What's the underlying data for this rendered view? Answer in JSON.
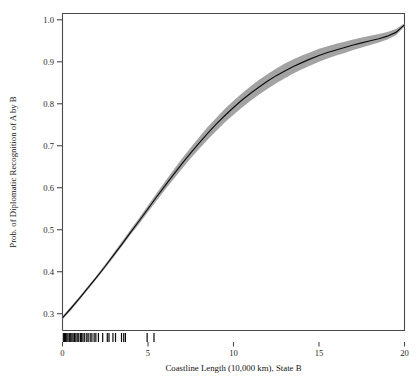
{
  "figure": {
    "width": 419,
    "height": 377,
    "background": "#ffffff"
  },
  "chart_data": {
    "type": "line",
    "title": "",
    "subtitle": "",
    "xlabel": "Coastline Length (10,000 km), State B",
    "ylabel": "Prob. of Diplomatic Recognition of A by B",
    "xlim": [
      0,
      20
    ],
    "ylim": [
      0.26,
      1.015
    ],
    "grid": false,
    "legend": null,
    "xticks": [
      0,
      5,
      10,
      15,
      20
    ],
    "xticklabels": [
      "0",
      "5",
      "10",
      "15",
      "20"
    ],
    "yticks": [
      0.3,
      0.4,
      0.5,
      0.6,
      0.7,
      0.8,
      0.9,
      1.0
    ],
    "yticklabels": [
      "0.3",
      "0.4",
      "0.5",
      "0.6",
      "0.7",
      "0.8",
      "0.9",
      "1.0"
    ],
    "colors": {
      "line": "#0d0d0d",
      "confidence_band": "#a3a3a3",
      "axis": "#4a4a4a",
      "rug": "#0a0a0a"
    },
    "series": [
      {
        "name": "Predicted probability",
        "style": "solid-line",
        "x": [
          0,
          0.5,
          1,
          1.5,
          2,
          2.5,
          3,
          3.5,
          4,
          4.5,
          5,
          5.5,
          6,
          6.5,
          7,
          7.5,
          8,
          8.5,
          9,
          9.5,
          10,
          10.5,
          11,
          11.5,
          12,
          12.5,
          13,
          13.5,
          14,
          14.5,
          15,
          15.5,
          16,
          16.5,
          17,
          17.5,
          18,
          18.5,
          19,
          19.5,
          20
        ],
        "values": [
          0.29,
          0.313,
          0.337,
          0.362,
          0.387,
          0.413,
          0.44,
          0.467,
          0.495,
          0.522,
          0.55,
          0.578,
          0.605,
          0.632,
          0.658,
          0.683,
          0.707,
          0.73,
          0.752,
          0.772,
          0.791,
          0.809,
          0.825,
          0.84,
          0.854,
          0.867,
          0.878,
          0.889,
          0.898,
          0.907,
          0.915,
          0.922,
          0.928,
          0.934,
          0.94,
          0.945,
          0.95,
          0.955,
          0.961,
          0.97,
          0.988
        ]
      },
      {
        "name": "95% confidence band — lower",
        "style": "band-lower",
        "x": [
          0,
          0.5,
          1,
          1.5,
          2,
          2.5,
          3,
          3.5,
          4,
          4.5,
          5,
          5.5,
          6,
          6.5,
          7,
          7.5,
          8,
          8.5,
          9,
          9.5,
          10,
          10.5,
          11,
          11.5,
          12,
          12.5,
          13,
          13.5,
          14,
          14.5,
          15,
          15.5,
          16,
          16.5,
          17,
          17.5,
          18,
          18.5,
          19,
          19.5,
          20
        ],
        "values": [
          0.286,
          0.309,
          0.333,
          0.358,
          0.383,
          0.409,
          0.435,
          0.462,
          0.489,
          0.515,
          0.542,
          0.569,
          0.595,
          0.621,
          0.646,
          0.67,
          0.693,
          0.715,
          0.736,
          0.756,
          0.774,
          0.791,
          0.807,
          0.822,
          0.836,
          0.849,
          0.861,
          0.872,
          0.882,
          0.891,
          0.9,
          0.908,
          0.915,
          0.921,
          0.928,
          0.934,
          0.94,
          0.946,
          0.953,
          0.963,
          0.984
        ]
      },
      {
        "name": "95% confidence band — upper",
        "style": "band-upper",
        "x": [
          0,
          0.5,
          1,
          1.5,
          2,
          2.5,
          3,
          3.5,
          4,
          4.5,
          5,
          5.5,
          6,
          6.5,
          7,
          7.5,
          8,
          8.5,
          9,
          9.5,
          10,
          10.5,
          11,
          11.5,
          12,
          12.5,
          13,
          13.5,
          14,
          14.5,
          15,
          15.5,
          16,
          16.5,
          17,
          17.5,
          18,
          18.5,
          19,
          19.5,
          20
        ],
        "values": [
          0.294,
          0.317,
          0.341,
          0.366,
          0.391,
          0.418,
          0.445,
          0.473,
          0.501,
          0.529,
          0.558,
          0.587,
          0.615,
          0.643,
          0.67,
          0.696,
          0.721,
          0.745,
          0.767,
          0.788,
          0.807,
          0.825,
          0.842,
          0.857,
          0.871,
          0.884,
          0.896,
          0.906,
          0.915,
          0.923,
          0.931,
          0.937,
          0.943,
          0.948,
          0.953,
          0.958,
          0.962,
          0.966,
          0.971,
          0.978,
          0.992
        ]
      }
    ],
    "rug": {
      "name": "data-rug-marks",
      "axis": "x",
      "values": [
        0.05,
        0.12,
        0.18,
        0.25,
        0.32,
        0.4,
        0.48,
        0.55,
        0.62,
        0.7,
        0.78,
        0.86,
        0.95,
        1.05,
        1.12,
        1.2,
        1.3,
        1.42,
        1.5,
        1.62,
        1.72,
        1.85,
        1.95,
        2.1,
        2.35,
        2.62,
        2.72,
        2.95,
        3.1,
        3.45,
        3.58,
        3.68,
        4.95,
        5.35
      ]
    }
  },
  "accessibility": {
    "figure_role": "statistical line chart with confidence band and rug plot"
  }
}
